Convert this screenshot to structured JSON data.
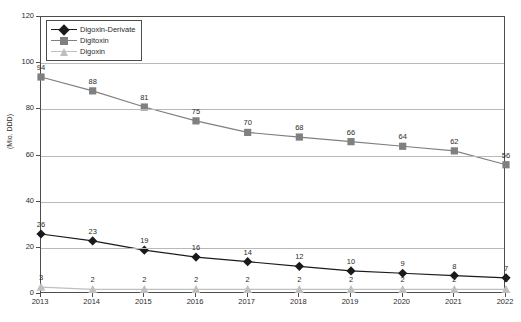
{
  "chart_data": {
    "type": "line",
    "title": "",
    "xlabel": "",
    "ylabel": "(Mio. DDD)",
    "categories": [
      "2013",
      "2014",
      "2015",
      "2016",
      "2017",
      "2018",
      "2019",
      "2020",
      "2021",
      "2022"
    ],
    "ylim": [
      0,
      120
    ],
    "yticks": [
      0,
      20,
      40,
      60,
      80,
      100,
      120
    ],
    "grid": true,
    "legend_position": "top-left-inside",
    "series": [
      {
        "name": "Digoxin-Derivate",
        "color": "#1a1a1a",
        "marker": "diamond",
        "values": [
          26,
          23,
          19,
          16,
          14,
          12,
          10,
          9,
          8,
          7
        ],
        "labels": [
          "26",
          "23",
          "19",
          "16",
          "14",
          "12",
          "10",
          "9",
          "8",
          "7"
        ]
      },
      {
        "name": "Digitoxin",
        "color": "#808080",
        "marker": "square",
        "values": [
          94,
          88,
          81,
          75,
          70,
          68,
          66,
          64,
          62,
          56
        ],
        "labels": [
          "94",
          "88",
          "81",
          "75",
          "70",
          "68",
          "66",
          "64",
          "62",
          "56"
        ]
      },
      {
        "name": "Digoxin",
        "color": "#bfbfbf",
        "marker": "triangle",
        "values": [
          3,
          2,
          2,
          2,
          2,
          2,
          2,
          2,
          2,
          2
        ],
        "labels": [
          "3",
          "2",
          "2",
          "2",
          "2",
          "2",
          "2",
          "2",
          "2",
          "2"
        ]
      }
    ]
  },
  "axis": {
    "y_tick_labels": [
      "0",
      "20",
      "40",
      "60",
      "80",
      "100",
      "120"
    ],
    "y_title": "(Mio. DDD)",
    "x_tick_labels": [
      "2013",
      "2014",
      "2015",
      "2016",
      "2017",
      "2018",
      "2019",
      "2020",
      "2021",
      "2022"
    ]
  },
  "legend": {
    "items": [
      {
        "label": "Digoxin-Derivate"
      },
      {
        "label": "Digitoxin"
      },
      {
        "label": "Digoxin"
      }
    ]
  }
}
